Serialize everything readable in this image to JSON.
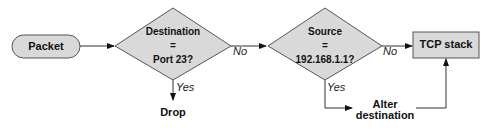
{
  "diagram": {
    "type": "flowchart",
    "colors": {
      "shape_fill": "#d9d9d9",
      "stroke": "#555555",
      "line": "#333333",
      "text": "#111111"
    },
    "nodes": [
      {
        "id": "packet",
        "shape": "rounded-rect",
        "label": "Packet"
      },
      {
        "id": "dest_check",
        "shape": "diamond",
        "line1": "Destination",
        "line2": "=",
        "line3": "Port 23?"
      },
      {
        "id": "src_check",
        "shape": "diamond",
        "line1": "Source",
        "line2": "=",
        "line3": "192.168.1.1?"
      },
      {
        "id": "tcp_stack",
        "shape": "rect",
        "label": "TCP stack"
      },
      {
        "id": "drop",
        "shape": "text",
        "label": "Drop"
      },
      {
        "id": "alter",
        "shape": "text",
        "line1": "Alter",
        "line2": "destination"
      }
    ],
    "edges": [
      {
        "from": "packet",
        "to": "dest_check",
        "label": ""
      },
      {
        "from": "dest_check",
        "to": "src_check",
        "label": "No"
      },
      {
        "from": "dest_check",
        "to": "drop",
        "label": "Yes"
      },
      {
        "from": "src_check",
        "to": "tcp_stack",
        "label": "No"
      },
      {
        "from": "src_check",
        "to": "alter",
        "label": "Yes"
      },
      {
        "from": "alter",
        "to": "tcp_stack",
        "label": ""
      }
    ]
  }
}
